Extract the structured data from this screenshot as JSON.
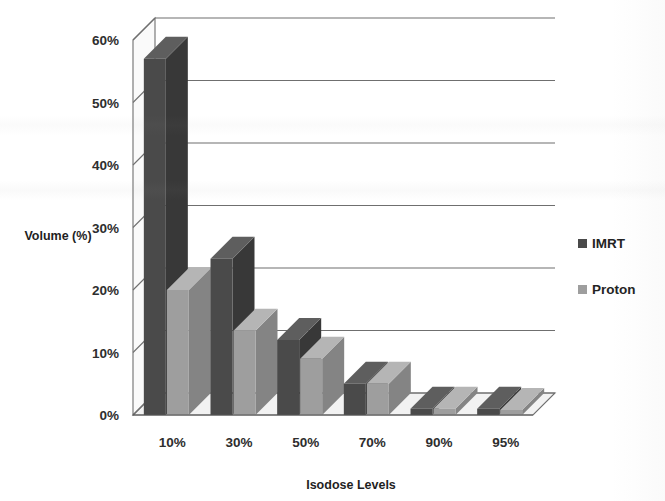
{
  "chart_data": {
    "type": "bar",
    "title": "",
    "subtitle": "",
    "xlabel": "Isodose Levels",
    "ylabel": "Volume (%)",
    "categories": [
      "10%",
      "30%",
      "50%",
      "70%",
      "90%",
      "95%"
    ],
    "series": [
      {
        "name": "IMRT",
        "color": "#4a4a4a",
        "values": [
          57,
          25,
          12,
          5,
          1,
          1
        ]
      },
      {
        "name": "Proton",
        "color": "#9e9e9e",
        "values": [
          20,
          13.5,
          9,
          5,
          1,
          0.8
        ]
      }
    ],
    "ylim": [
      0,
      60
    ],
    "yticks": [
      "0%",
      "10%",
      "20%",
      "30%",
      "40%",
      "50%",
      "60%"
    ],
    "ytick_values": [
      0,
      10,
      20,
      30,
      40,
      50,
      60
    ],
    "grid": true,
    "grid_axis": "y",
    "legend_position": "right",
    "style": "3d-column",
    "appearance": "grayscale-scanned"
  },
  "axes": {
    "y_title": "Volume (%)",
    "x_title": "Isodose Levels"
  },
  "legend": {
    "entries": [
      {
        "label": "IMRT",
        "swatch": "#4a4a4a"
      },
      {
        "label": "Proton",
        "swatch": "#9e9e9e"
      }
    ]
  },
  "colors": {
    "imrt": "#4a4a4a",
    "imrt_top": "#5e5e5e",
    "imrt_side": "#383838",
    "proton": "#9e9e9e",
    "proton_top": "#b5b5b5",
    "proton_side": "#848484",
    "gridline": "#6f6f6f",
    "floor": "#f2f2f2",
    "text": "#2b2b2b"
  }
}
